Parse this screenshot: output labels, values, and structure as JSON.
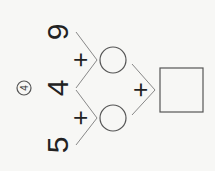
{
  "problem": {
    "label": "4",
    "numbers": [
      "9",
      "4",
      "5"
    ],
    "operators": [
      "+",
      "+",
      "+"
    ],
    "blanks": [
      "circle",
      "circle",
      "square"
    ],
    "rotation_deg": -90
  }
}
